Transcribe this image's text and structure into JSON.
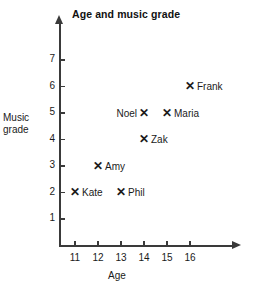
{
  "chart_data": {
    "type": "scatter",
    "title": "Age and music grade",
    "xlabel": "Age",
    "ylabel": "Music grade",
    "xlim": [
      10.5,
      16.9
    ],
    "ylim": [
      0,
      7.6
    ],
    "grid": false,
    "legend": "none",
    "x_ticks": [
      11,
      12,
      13,
      14,
      15,
      16
    ],
    "y_ticks": [
      1,
      2,
      3,
      4,
      5,
      6,
      7
    ],
    "marker": "x-cross",
    "points": [
      {
        "name": "Kate",
        "x": 11,
        "y": 2,
        "label_side": "right"
      },
      {
        "name": "Amy",
        "x": 12,
        "y": 3,
        "label_side": "right"
      },
      {
        "name": "Phil",
        "x": 13,
        "y": 2,
        "label_side": "right"
      },
      {
        "name": "Noel",
        "x": 14,
        "y": 5,
        "label_side": "left"
      },
      {
        "name": "Zak",
        "x": 14,
        "y": 4,
        "label_side": "right"
      },
      {
        "name": "Maria",
        "x": 15,
        "y": 5,
        "label_side": "right"
      },
      {
        "name": "Frank",
        "x": 16,
        "y": 6,
        "label_side": "right"
      }
    ]
  },
  "ylabel_lines": [
    "Music",
    "grade"
  ],
  "marker_glyph": "✕"
}
